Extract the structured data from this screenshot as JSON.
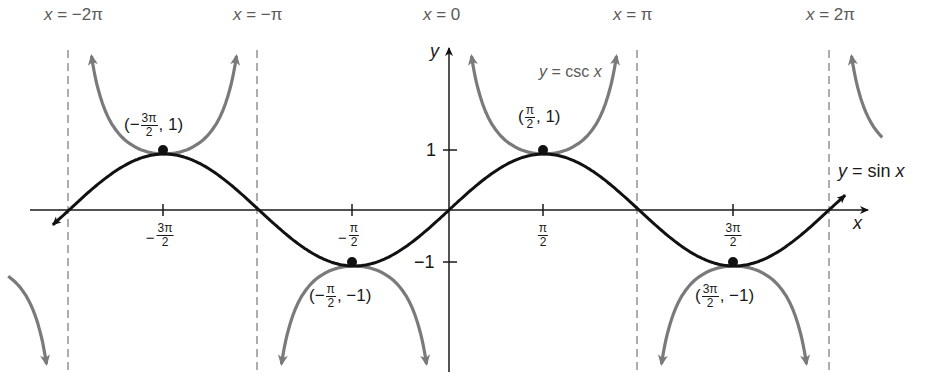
{
  "chart_data": {
    "type": "line",
    "title": "",
    "xlabel": "x",
    "ylabel": "y",
    "xlim": [
      -6.6,
      6.6
    ],
    "ylim": [
      -2.7,
      3.2
    ],
    "grid": false,
    "x_ticks": [
      {
        "value": -4.712,
        "label_sign": "−",
        "num": "3π",
        "den": "2"
      },
      {
        "value": -1.571,
        "label_sign": "−",
        "num": "π",
        "den": "2"
      },
      {
        "value": 1.571,
        "label_sign": "",
        "num": "π",
        "den": "2"
      },
      {
        "value": 4.712,
        "label_sign": "",
        "num": "3π",
        "den": "2"
      }
    ],
    "y_ticks": [
      {
        "value": 1,
        "label": "1"
      },
      {
        "value": -1,
        "label": "−1"
      }
    ],
    "series": [
      {
        "name": "y = sin x",
        "function": "sin",
        "color": "#111111",
        "x_range": [
          -6.6,
          6.6
        ]
      },
      {
        "name": "y = csc x",
        "function": "csc",
        "color": "#7a7a7a",
        "x_range": [
          -6.6,
          6.6
        ]
      }
    ],
    "asymptotes": [
      {
        "x": -6.283,
        "label": "x = −2π"
      },
      {
        "x": -3.1416,
        "label": "x = −π"
      },
      {
        "x": 0,
        "label": "x = 0"
      },
      {
        "x": 3.1416,
        "label": "x = π"
      },
      {
        "x": 6.283,
        "label": "x = 2π"
      }
    ],
    "points": [
      {
        "x": -4.712,
        "y": 1,
        "label": "(−3π/2, 1)"
      },
      {
        "x": -1.571,
        "y": -1,
        "label": "(−π/2, −1)"
      },
      {
        "x": 1.571,
        "y": 1,
        "label": "(π/2, 1)"
      },
      {
        "x": 4.712,
        "y": -1,
        "label": "(3π/2, −1)"
      }
    ],
    "annotations": [
      "y = csc x",
      "y = sin x"
    ]
  },
  "labels": {
    "asym_neg2pi": "x = −2π",
    "asym_negpi": "x = −π",
    "asym_zero": "x = 0",
    "asym_pi": "x = π",
    "asym_2pi": "x = 2π",
    "csc_label_y": "y",
    "csc_label_eq": " = csc ",
    "csc_label_x": "x",
    "sin_label_y": "y",
    "sin_label_eq": " = sin ",
    "sin_label_x": "x",
    "x_axis": "x",
    "y_axis": "y",
    "ytick_pos1": "1",
    "ytick_neg1": "−1",
    "pt1_open": "(−",
    "pt1_num": "3π",
    "pt1_den": "2",
    "pt1_close": ", 1)",
    "pt2_open": "(−",
    "pt2_num": "π",
    "pt2_den": "2",
    "pt2_close": ", −1)",
    "pt3_open": "(",
    "pt3_num": "π",
    "pt3_den": "2",
    "pt3_close": ", 1)",
    "pt4_open": "(",
    "pt4_num": "3π",
    "pt4_den": "2",
    "pt4_close": ", −1)",
    "xt1_minus": "−",
    "xt1_num": "3π",
    "xt1_den": "2",
    "xt2_minus": "−",
    "xt2_num": "π",
    "xt2_den": "2",
    "xt3_num": "π",
    "xt3_den": "2",
    "xt4_num": "3π",
    "xt4_den": "2"
  },
  "colors": {
    "sin": "#111111",
    "csc": "#7a7a7a",
    "asymptote": "#777777",
    "axis": "#1a1a1a"
  }
}
